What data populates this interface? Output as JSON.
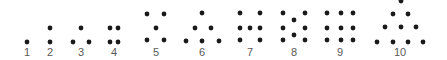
{
  "diagram": {
    "dot_color": "#1a1a1a",
    "label_color": "#5a5a5a",
    "dot_radius": 2.4,
    "groups": [
      {
        "label": "1",
        "label_x": 27,
        "dots": [
          [
            27,
            42
          ]
        ]
      },
      {
        "label": "2",
        "label_x": 50,
        "dots": [
          [
            50,
            28
          ],
          [
            50,
            42
          ]
        ]
      },
      {
        "label": "3",
        "label_x": 81,
        "dots": [
          [
            81,
            28
          ],
          [
            73,
            42
          ],
          [
            89,
            42
          ]
        ]
      },
      {
        "label": "4",
        "label_x": 114,
        "dots": [
          [
            110,
            28
          ],
          [
            118,
            28
          ],
          [
            110,
            42
          ],
          [
            118,
            42
          ]
        ]
      },
      {
        "label": "5",
        "label_x": 156,
        "dots": [
          [
            147,
            14
          ],
          [
            164,
            14
          ],
          [
            156,
            28
          ],
          [
            147,
            40
          ],
          [
            164,
            40
          ]
        ]
      },
      {
        "label": "6",
        "label_x": 202,
        "dots": [
          [
            202,
            13
          ],
          [
            195,
            28
          ],
          [
            211,
            28
          ],
          [
            186,
            41
          ],
          [
            202,
            41
          ],
          [
            219,
            41
          ]
        ]
      },
      {
        "label": "7",
        "label_x": 250,
        "dots": [
          [
            240,
            13
          ],
          [
            260,
            13
          ],
          [
            240,
            28
          ],
          [
            250,
            28
          ],
          [
            260,
            28
          ],
          [
            240,
            40
          ],
          [
            260,
            40
          ]
        ]
      },
      {
        "label": "8",
        "label_x": 294,
        "dots": [
          [
            283,
            13
          ],
          [
            305,
            13
          ],
          [
            294,
            20
          ],
          [
            283,
            28
          ],
          [
            305,
            28
          ],
          [
            294,
            35
          ],
          [
            283,
            40
          ],
          [
            305,
            40
          ]
        ]
      },
      {
        "label": "9",
        "label_x": 340,
        "dots": [
          [
            327,
            13
          ],
          [
            341,
            13
          ],
          [
            353,
            13
          ],
          [
            327,
            28
          ],
          [
            341,
            28
          ],
          [
            353,
            28
          ],
          [
            327,
            40
          ],
          [
            341,
            40
          ],
          [
            353,
            40
          ]
        ]
      },
      {
        "label": "10",
        "label_x": 400,
        "dots": [
          [
            401,
            1
          ],
          [
            393,
            14
          ],
          [
            408,
            14
          ],
          [
            385,
            27
          ],
          [
            401,
            27
          ],
          [
            416,
            27
          ],
          [
            377,
            42
          ],
          [
            393,
            42
          ],
          [
            408,
            42
          ],
          [
            423,
            42
          ]
        ]
      }
    ]
  }
}
